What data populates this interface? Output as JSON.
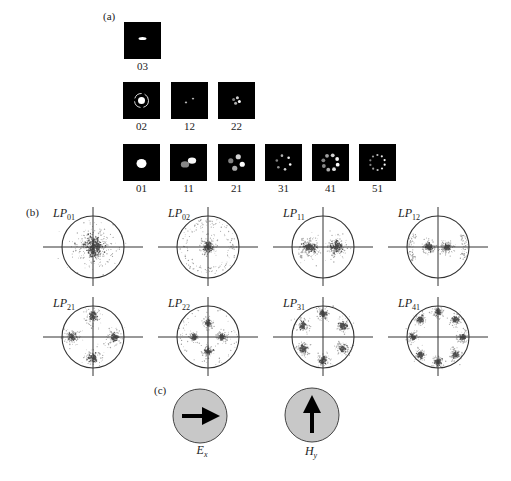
{
  "figure": {
    "colors": {
      "background": "#ffffff",
      "mode_image_background": "#000000",
      "mode_image_spot": "#ffffff",
      "plot_outline": "#333333",
      "stipple": "#3a3a3a",
      "field_circle_fill": "#c8c8c8",
      "arrow": "#000000"
    }
  },
  "panel_a": {
    "label": "(a)",
    "rows": [
      [
        {
          "mode": "03",
          "l": 0,
          "m": 3
        }
      ],
      [
        {
          "mode": "02",
          "l": 0,
          "m": 2
        },
        {
          "mode": "12",
          "l": 1,
          "m": 2
        },
        {
          "mode": "22",
          "l": 2,
          "m": 2
        }
      ],
      [
        {
          "mode": "01",
          "l": 0,
          "m": 1
        },
        {
          "mode": "11",
          "l": 1,
          "m": 1
        },
        {
          "mode": "21",
          "l": 2,
          "m": 1
        },
        {
          "mode": "31",
          "l": 3,
          "m": 1
        },
        {
          "mode": "41",
          "l": 4,
          "m": 1
        },
        {
          "mode": "51",
          "l": 5,
          "m": 1
        }
      ]
    ]
  },
  "panel_b": {
    "label": "(b)",
    "plots": [
      {
        "prefix": "LP",
        "subscript": "01",
        "l": 0,
        "m": 1
      },
      {
        "prefix": "LP",
        "subscript": "02",
        "l": 0,
        "m": 2
      },
      {
        "prefix": "LP",
        "subscript": "11",
        "l": 1,
        "m": 1
      },
      {
        "prefix": "LP",
        "subscript": "12",
        "l": 1,
        "m": 2
      },
      {
        "prefix": "LP",
        "subscript": "21",
        "l": 2,
        "m": 1
      },
      {
        "prefix": "LP",
        "subscript": "22",
        "l": 2,
        "m": 2
      },
      {
        "prefix": "LP",
        "subscript": "31",
        "l": 3,
        "m": 1
      },
      {
        "prefix": "LP",
        "subscript": "41",
        "l": 4,
        "m": 1
      }
    ]
  },
  "panel_c": {
    "label": "(c)",
    "fields": [
      {
        "symbol": "E",
        "subscript": "x",
        "arrow_direction": "right"
      },
      {
        "symbol": "H",
        "subscript": "y",
        "arrow_direction": "up"
      }
    ]
  }
}
